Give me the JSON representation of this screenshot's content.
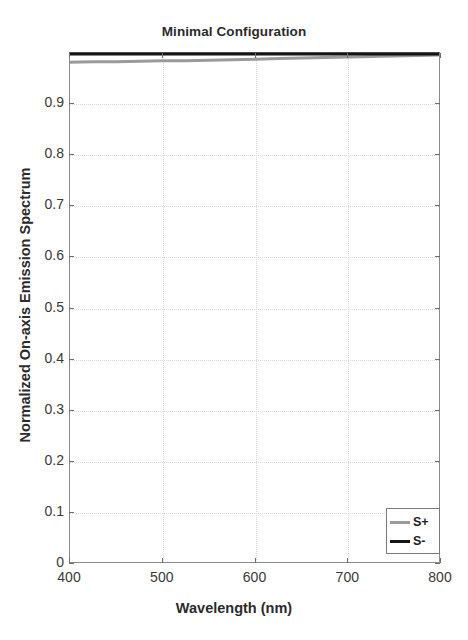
{
  "chart_data": {
    "type": "line",
    "title": "Minimal Configuration",
    "xlabel": "Wavelength (nm)",
    "ylabel": "Normalized On-axis Emission Spectrum",
    "xlim": [
      400,
      800
    ],
    "ylim": [
      0,
      1
    ],
    "grid": true,
    "legend_position": "lower-right",
    "xticks": [
      400,
      500,
      600,
      700,
      800
    ],
    "xtick_labels": [
      "400",
      "500",
      "600",
      "700",
      "800"
    ],
    "yticks": [
      0,
      0.1,
      0.2,
      0.3,
      0.4,
      0.5,
      0.6,
      0.7,
      0.8,
      0.9
    ],
    "ytick_labels": [
      "0",
      "0.1",
      "0.2",
      "0.3",
      "0.4",
      "0.5",
      "0.6",
      "0.7",
      "0.8",
      "0.9"
    ],
    "x": [
      400,
      425,
      450,
      475,
      500,
      525,
      550,
      575,
      600,
      625,
      650,
      675,
      700,
      725,
      750,
      775,
      800
    ],
    "series": [
      {
        "name": "S+",
        "color": "#9a9a9a",
        "values": [
          0.982,
          0.983,
          0.983,
          0.984,
          0.985,
          0.985,
          0.986,
          0.987,
          0.988,
          0.989,
          0.99,
          0.991,
          0.992,
          0.993,
          0.994,
          0.995,
          0.996
        ]
      },
      {
        "name": "S-",
        "color": "#141414",
        "values": [
          0.998,
          0.998,
          0.998,
          0.998,
          0.998,
          0.998,
          0.998,
          0.998,
          0.998,
          0.998,
          0.998,
          0.998,
          0.998,
          0.998,
          0.998,
          0.998,
          0.998
        ]
      }
    ]
  },
  "legend": {
    "entries": [
      {
        "label": "S+"
      },
      {
        "label": "S-"
      }
    ]
  }
}
